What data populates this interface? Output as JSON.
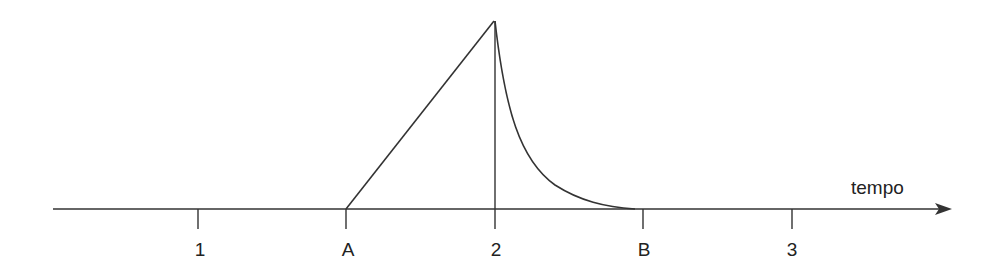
{
  "diagram": {
    "axis_label": "tempo",
    "ticks": [
      {
        "label": "1",
        "x": 198
      },
      {
        "label": "A",
        "x": 346
      },
      {
        "label": "2",
        "x": 495
      },
      {
        "label": "B",
        "x": 643
      },
      {
        "label": "3",
        "x": 792
      }
    ],
    "shape": {
      "rise_start": "A",
      "peak_at": "2",
      "decay_end": "B",
      "description": "linear rise from A to peak at 2, then exponential-like decay back to baseline near B"
    },
    "colors": {
      "line": "#333333",
      "background": "#ffffff"
    }
  }
}
